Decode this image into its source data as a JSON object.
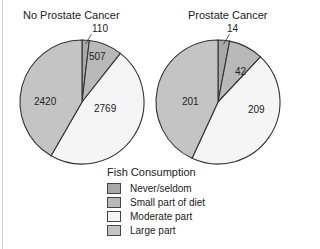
{
  "chart_data": {
    "type": "pie",
    "title": "",
    "legend_title": "Fish Consumption",
    "legend_position": "bottom-center",
    "categories": [
      "Never/seldom",
      "Small part of diet",
      "Moderate part",
      "Large part"
    ],
    "colors": [
      "#a9a9a9",
      "#b9b9b9",
      "#f5f5f5",
      "#c4c4c4"
    ],
    "pies": [
      {
        "title": "No Prostate Cancer",
        "values": [
          110,
          507,
          2769,
          2420
        ]
      },
      {
        "title": "Prostate Cancer",
        "values": [
          14,
          42,
          209,
          201
        ]
      }
    ]
  },
  "pies": [
    {
      "title": "No Prostate Cancer",
      "labels": [
        "110",
        "507",
        "2769",
        "2420"
      ]
    },
    {
      "title": "Prostate Cancer",
      "labels": [
        "14",
        "42",
        "209",
        "201"
      ]
    }
  ],
  "legend": {
    "title": "Fish Consumption",
    "items": [
      {
        "label": "Never/seldom",
        "color": "#a9a9a9"
      },
      {
        "label": "Small part of diet",
        "color": "#b9b9b9"
      },
      {
        "label": "Moderate part",
        "color": "#f5f5f5"
      },
      {
        "label": "Large part",
        "color": "#c4c4c4"
      }
    ]
  }
}
